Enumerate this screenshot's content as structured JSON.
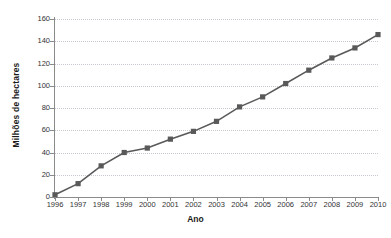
{
  "chart_data": {
    "type": "line",
    "title": "",
    "xlabel": "Ano",
    "ylabel": "Milhões de hectares",
    "categories": [
      "1996",
      "1997",
      "1998",
      "1999",
      "2000",
      "2001",
      "2002",
      "2003",
      "2004",
      "2005",
      "2006",
      "2007",
      "2008",
      "2009",
      "2010"
    ],
    "x": [
      1996,
      1997,
      1998,
      1999,
      2000,
      2001,
      2002,
      2003,
      2004,
      2005,
      2006,
      2007,
      2008,
      2009,
      2010
    ],
    "values": [
      2,
      12,
      28,
      40,
      44,
      52,
      59,
      68,
      81,
      90,
      102,
      114,
      125,
      134,
      146
    ],
    "series": [
      {
        "name": "Milhões de hectares",
        "values": [
          2,
          12,
          28,
          40,
          44,
          52,
          59,
          68,
          81,
          90,
          102,
          114,
          125,
          134,
          146
        ]
      }
    ],
    "ylim": [
      0,
      160
    ],
    "yticks": [
      0,
      20,
      40,
      60,
      80,
      100,
      120,
      140,
      160
    ],
    "ytick_labels": [
      "0",
      "20",
      "40",
      "60",
      "80",
      "100",
      "120",
      "140",
      "160"
    ],
    "xlim": [
      1996,
      2010
    ],
    "grid": true,
    "grid_axis": "y",
    "grid_style": "dotted",
    "legend": false,
    "legend_position": "none",
    "marker": "square",
    "colors": {
      "line": "#595959",
      "marker": "#595959",
      "grid": "#c8c8d0",
      "axis": "#8a8a8a",
      "text": "#333333",
      "axis_title": "#1a1a1a",
      "background": "#ffffff"
    }
  }
}
